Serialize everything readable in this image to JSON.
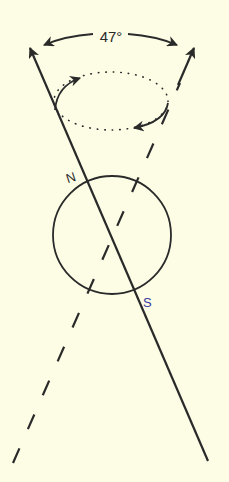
{
  "diagram": {
    "angle_label": "47°",
    "north_label": "N",
    "south_label": "S",
    "colors": {
      "background": "#fdfde6",
      "ink": "#2a2a2a",
      "south_label": "#3a3aa0"
    }
  }
}
